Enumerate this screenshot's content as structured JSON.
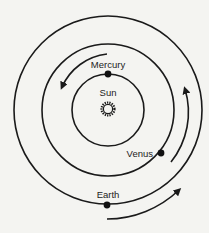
{
  "diagram": {
    "title": "",
    "center_body": {
      "label": "Sun"
    },
    "planets": [
      {
        "label": "Mercury",
        "orbit": "inner"
      },
      {
        "label": "Venus",
        "orbit": "middle"
      },
      {
        "label": "Earth",
        "orbit": "outer"
      }
    ],
    "orbit_direction": "counter-clockwise",
    "colors": {
      "background": "#f4f4f1",
      "ink": "#1a1a1a"
    }
  }
}
